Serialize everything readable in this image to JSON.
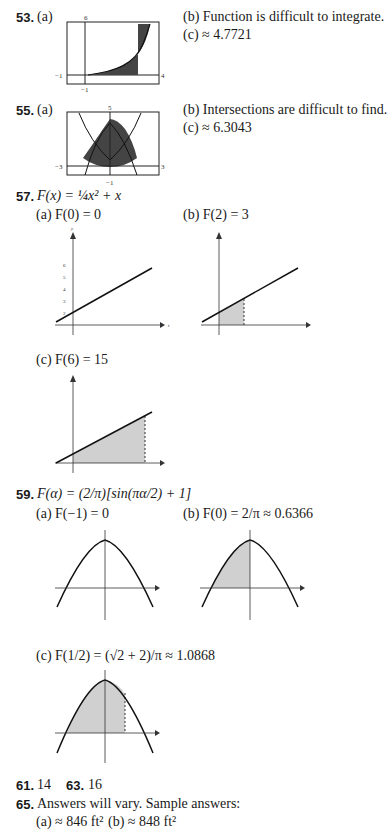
{
  "problems": {
    "p53": {
      "number": "53.",
      "part_a": "(a)",
      "part_b": "(b)  Function is difficult to integrate.",
      "part_c": "(c)  ≈ 4.7721",
      "graph": {
        "top_label": "6",
        "left_label": "−1",
        "right_label": "4",
        "bottom_label": "−1"
      }
    },
    "p55": {
      "number": "55.",
      "part_a": "(a)",
      "part_b": "(b)  Intersections are difficult to find.",
      "part_c": "(c)  ≈ 6.3043",
      "graph": {
        "top_label": "5",
        "left_label": "−3",
        "right_label": "3",
        "bottom_label": "−1"
      }
    },
    "p57": {
      "number": "57.",
      "formula": "F(x) = ¼x² + x",
      "part_a": "(a)  F(0) = 0",
      "part_b": "(b)  F(2) = 3",
      "part_c": "(c)  F(6) = 15",
      "axis": {
        "x_label": "t",
        "y_label": "y",
        "x_ticks": [
          "−1",
          "1",
          "2",
          "3",
          "4",
          "5",
          "6"
        ],
        "y_ticks": [
          "−1",
          "2",
          "3",
          "4",
          "5",
          "6"
        ]
      }
    },
    "p59": {
      "number": "59.",
      "formula": "F(α) = (2/π)[sin(πα/2) + 1]",
      "part_a": "(a)  F(−1) = 0",
      "part_b": "(b)  F(0) = 2/π ≈ 0.6366",
      "part_c": "(c)  F(1/2) = (√2 + 2)/π ≈ 1.0868",
      "axis": {
        "x_label": "θ",
        "y_label": "y",
        "x_ticks": [
          "−½",
          "½",
          "1"
        ],
        "y_ticks": [
          "3/2",
          "½",
          "−½"
        ]
      }
    },
    "p61": {
      "number": "61.",
      "answer": "14"
    },
    "p63": {
      "number": "63.",
      "answer": "16"
    },
    "p65": {
      "number": "65.",
      "text": "Answers will vary. Sample answers:",
      "part_a": "(a)  ≈ 846 ft²",
      "part_b": "(b)  ≈ 848 ft²"
    }
  },
  "colors": {
    "dark_fill": "#4a4a4a",
    "light_fill": "#d0d0d0",
    "line": "#111111"
  }
}
